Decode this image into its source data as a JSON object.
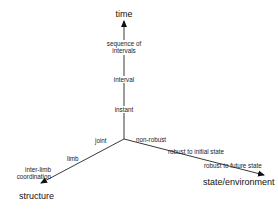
{
  "diagram": {
    "axes": {
      "time": {
        "label": "time",
        "ticks": [
          "instant",
          "interval",
          "sequence of intervals"
        ]
      },
      "structure": {
        "label": "structure",
        "ticks": [
          "joint",
          "limb",
          "inter-limb coordination"
        ]
      },
      "state": {
        "label": "state/environment",
        "ticks": [
          "non-robust",
          "robust to initial state",
          "robust to future state"
        ]
      }
    },
    "labels": {
      "time": "time",
      "seq_line1": "sequence of",
      "seq_line2": "intervals",
      "interval": "interval",
      "instant": "instant",
      "joint": "joint",
      "limb": "limb",
      "interlimb_line1": "inter-limb",
      "interlimb_line2": "coordination",
      "structure": "structure",
      "non_robust": "non-robust",
      "robust_initial": "robust to initial state",
      "robust_future": "robust to future state",
      "state": "state/environment"
    }
  }
}
